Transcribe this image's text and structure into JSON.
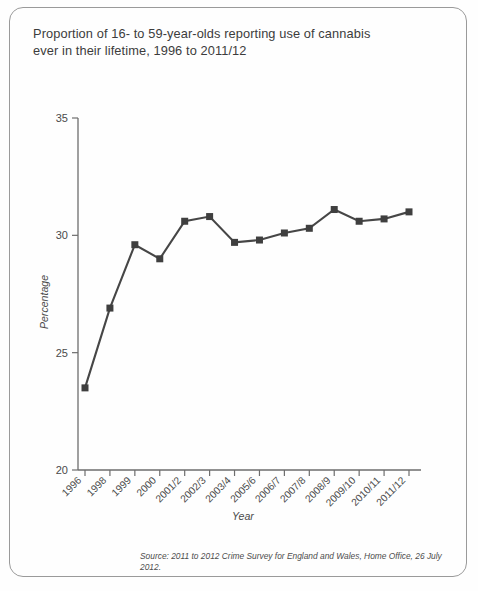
{
  "card": {
    "title": "Proportion of 16- to 59-year-olds reporting use of cannabis\never in their lifetime, 1996 to 2011/12",
    "source_note": "Source: 2011 to 2012 Crime Survey for England and Wales, Home Office, 26 July 2012."
  },
  "chart_data": {
    "type": "line",
    "title": "Proportion of 16- to 59-year-olds reporting use of cannabis ever in their lifetime, 1996 to 2011/12",
    "xlabel": "Year",
    "ylabel": "Percentage",
    "categories": [
      "1996",
      "1998",
      "1999",
      "2000",
      "2001/2",
      "2002/3",
      "2003/4",
      "2005/6",
      "2006/7",
      "2007/8",
      "2008/9",
      "2009/10",
      "2010/11",
      "2011/12"
    ],
    "values": [
      23.5,
      26.9,
      29.6,
      29.0,
      30.6,
      30.8,
      29.7,
      29.8,
      30.1,
      30.3,
      31.1,
      30.6,
      30.7,
      31.0
    ],
    "ylim": [
      20,
      35
    ],
    "yticks": [
      20,
      25,
      30,
      35
    ],
    "ytick_labels": [
      "20",
      "25",
      "30",
      "35"
    ],
    "grid": false,
    "legend": false,
    "marker": "square",
    "series_color": "#464646",
    "axis_color": "#6d6d6d"
  }
}
